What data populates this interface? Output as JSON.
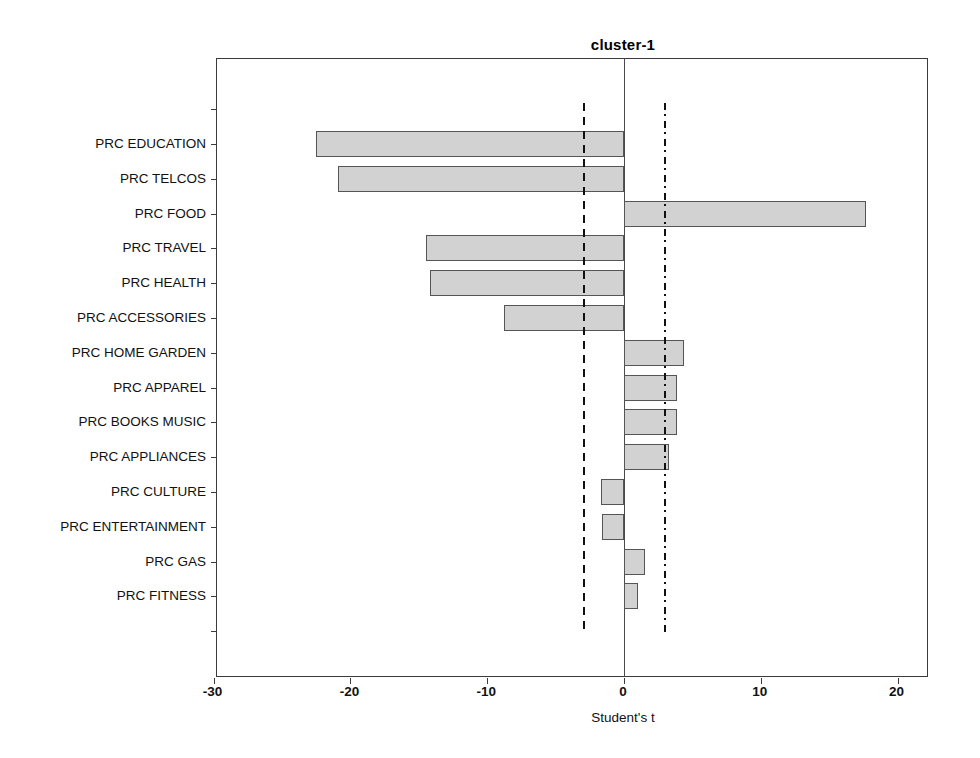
{
  "chart_data": {
    "type": "bar",
    "orientation": "horizontal",
    "title": "cluster-1",
    "xlabel": "Student's t",
    "ylabel": "",
    "xlim": [
      -30,
      23
    ],
    "xticks": [
      -30,
      -20,
      -10,
      0,
      10,
      20
    ],
    "xticklabels": [
      "-30",
      "-20",
      "-10",
      "0",
      "10",
      "20"
    ],
    "grid": false,
    "legend": null,
    "categories": [
      "PRC EDUCATION",
      "PRC TELCOS",
      "PRC FOOD",
      "PRC TRAVEL",
      "PRC HEALTH",
      "PRC ACCESSORIES",
      "PRC HOME GARDEN",
      "PRC APPAREL",
      "PRC BOOKS MUSIC",
      "PRC APPLIANCES",
      "PRC CULTURE",
      "PRC ENTERTAINMENT",
      "PRC GAS",
      "PRC FITNESS"
    ],
    "values": [
      -22.5,
      -20.9,
      17.7,
      -14.5,
      -14.2,
      -8.8,
      4.4,
      3.9,
      3.9,
      3.3,
      -1.7,
      -1.6,
      1.5,
      1.0
    ],
    "reference_lines": [
      {
        "name": "lower-threshold",
        "value": -2.9,
        "style": "dashed"
      },
      {
        "name": "upper-threshold",
        "value": 3.0,
        "style": "dash-dot"
      }
    ],
    "bar_fill_color": "#d2d2d2",
    "bar_edge_color": "#555555",
    "axis_color": "#3b3b3b"
  }
}
